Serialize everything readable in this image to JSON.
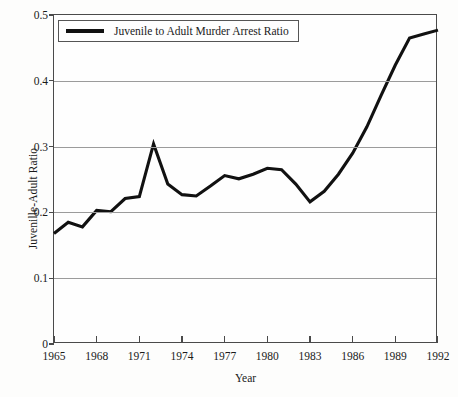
{
  "chart_data": {
    "type": "line",
    "title": "",
    "xlabel": "Year",
    "ylabel": "Juvenille-Adult Ratio",
    "xlim": [
      1965,
      1992
    ],
    "ylim": [
      0,
      0.5
    ],
    "grid": true,
    "grid_axis": "y",
    "legend_position": "top-left-inside",
    "y_ticks": [
      "0",
      "0.1",
      "0.2",
      "0.3",
      "0.4",
      "0.5"
    ],
    "y_tick_values": [
      0,
      0.1,
      0.2,
      0.3,
      0.4,
      0.5
    ],
    "x_ticks": [
      "1965",
      "1968",
      "1971",
      "1974",
      "1977",
      "1980",
      "1983",
      "1986",
      "1989",
      "1992"
    ],
    "x_tick_values": [
      1965,
      1968,
      1971,
      1974,
      1977,
      1980,
      1983,
      1986,
      1989,
      1992
    ],
    "series": [
      {
        "name": "Juvenile to Adult Murder Arrest Ratio",
        "color": "#111111",
        "x": [
          1965,
          1966,
          1967,
          1968,
          1969,
          1970,
          1971,
          1972,
          1973,
          1974,
          1975,
          1976,
          1977,
          1978,
          1979,
          1980,
          1981,
          1982,
          1983,
          1984,
          1985,
          1986,
          1987,
          1988,
          1989,
          1990,
          1991,
          1992
        ],
        "values": [
          0.168,
          0.185,
          0.178,
          0.203,
          0.201,
          0.221,
          0.224,
          0.304,
          0.243,
          0.227,
          0.225,
          0.24,
          0.256,
          0.251,
          0.258,
          0.267,
          0.265,
          0.243,
          0.216,
          0.232,
          0.258,
          0.29,
          0.33,
          0.378,
          0.424,
          0.465,
          0.471,
          0.477
        ]
      }
    ]
  },
  "legend": {
    "entries": [
      {
        "label": "Juvenile to Adult Murder Arrest Ratio",
        "color": "#111111"
      }
    ]
  },
  "axes": {
    "x_title": "Year",
    "y_title": "Juvenille-Adult Ratio"
  },
  "colors": {
    "line": "#111111",
    "frame": "#4a4a4a",
    "gridline": "#9b9b9b",
    "background": "#fefefe",
    "text": "#1a1a1a"
  }
}
